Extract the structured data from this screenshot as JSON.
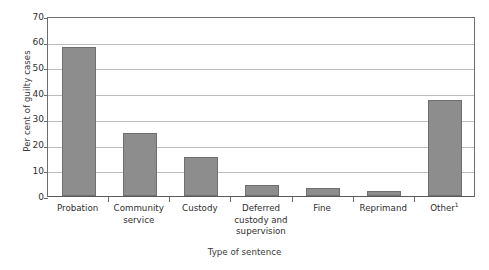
{
  "chart_data": {
    "type": "bar",
    "title": "",
    "subtitle": "",
    "xlabel": "Type of sentence",
    "ylabel": "Per cent of guilty cases",
    "categories": [
      "Probation",
      "Community service",
      "Custody",
      "Deferred custody and supervision",
      "Fine",
      "Reprimand",
      "Other"
    ],
    "category_lines": [
      [
        "Probation"
      ],
      [
        "Community",
        "service"
      ],
      [
        "Custody"
      ],
      [
        "Deferred",
        "custody and",
        "supervision"
      ],
      [
        "Fine"
      ],
      [
        "Reprimand"
      ],
      [
        "Other"
      ]
    ],
    "category_footnotes": [
      "",
      "",
      "",
      "",
      "",
      "",
      "1"
    ],
    "values": [
      58,
      24.5,
      15,
      4.4,
      3,
      2,
      37.5
    ],
    "ylim": [
      0,
      70
    ],
    "y_ticks": [
      0,
      10,
      20,
      30,
      40,
      50,
      60,
      70
    ],
    "y_tick_labels": [
      "0",
      "10",
      "20",
      "30",
      "40",
      "50",
      "60",
      "70"
    ],
    "grid": "horizontal",
    "legend": "none",
    "series": [
      {
        "name": "Per cent of guilty cases",
        "values": [
          58,
          24.5,
          15,
          4.4,
          3,
          2,
          37.5
        ]
      }
    ],
    "colors": {
      "bar_fill": "#8d8d8d",
      "bar_edge": "#6f6f6f",
      "gridline": "#bdbdbd",
      "axis": "#6d6d6d",
      "text": "#2e2e2e",
      "background": "#ffffff"
    }
  }
}
